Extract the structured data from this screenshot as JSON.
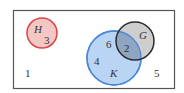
{
  "diagram": {
    "type": "venn",
    "universe": {
      "label": "1",
      "frame_color": "#555555"
    },
    "sets": [
      {
        "name": "H",
        "region_values": [
          "3"
        ],
        "stroke": "#d9454b",
        "fill": "#f4c7c5"
      },
      {
        "name": "K",
        "region_values": [
          "6",
          "4"
        ],
        "stroke": "#4a88d6",
        "fill": "#b9d5f3"
      },
      {
        "name": "G",
        "region_values": [],
        "stroke": "#2b2b2b",
        "fill": "#cbcbcb"
      }
    ],
    "intersections": [
      {
        "sets": [
          "K",
          "G"
        ],
        "value": "2",
        "fill": "#8ea6c2"
      }
    ],
    "outside_values": [
      "1",
      "5"
    ]
  },
  "labels": {
    "H": "H",
    "H_value": "3",
    "K": "K",
    "K_value_a": "6",
    "K_value_b": "4",
    "G": "G",
    "KG_value": "2",
    "outside_left": "1",
    "outside_right": "5"
  }
}
